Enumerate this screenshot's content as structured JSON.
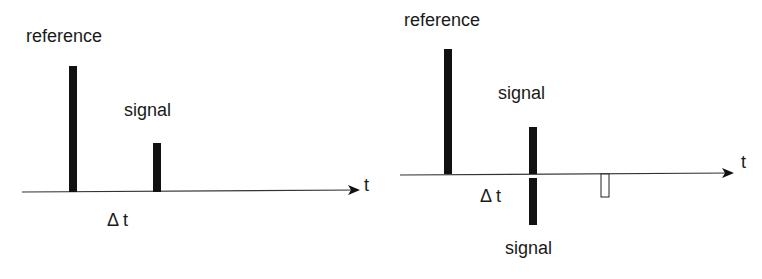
{
  "left_panel": {
    "reference_label": "reference",
    "signal_label": "signal",
    "delta_label": "Δ t",
    "axis_label": "t"
  },
  "right_panel": {
    "reference_label": "reference",
    "signal_up_label": "signal",
    "signal_down_label": "signal",
    "delta_label": "Δ t",
    "axis_label": "t"
  },
  "colors": {
    "ink": "#111111",
    "background": "#ffffff"
  }
}
